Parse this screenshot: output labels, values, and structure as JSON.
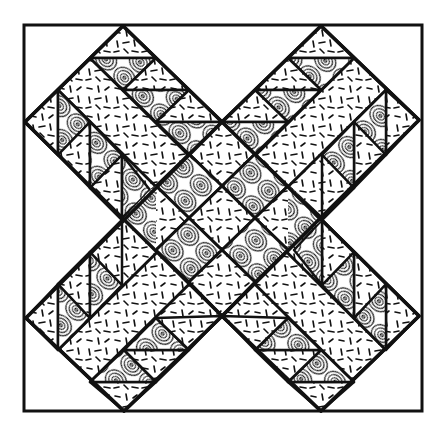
{
  "diagram": {
    "layout": "two crossing diagonal arms (X) inside a square frame",
    "colors": {
      "background": "#ffffff",
      "outline": "#111111",
      "swirl_fill": "#ffffff",
      "confetti_fill": "#ffffff"
    },
    "fabrics": [
      {
        "name": "confetti",
        "description": "white with short black dashes"
      },
      {
        "name": "swirl",
        "description": "concentric oval rings"
      }
    ],
    "frame": {
      "x": 24,
      "y": 25,
      "width": 398,
      "height": 386
    },
    "center": {
      "x": 222,
      "y": 218
    },
    "arms": [
      {
        "name": "arm-top-left-to-bottom-right",
        "direction": "diagonal \\"
      },
      {
        "name": "arm-top-right-to-bottom-left",
        "direction": "diagonal /"
      }
    ],
    "apexes": {
      "top_left_arm": {
        "x": 123,
        "y": 26
      },
      "top_right_arm": {
        "x": 321,
        "y": 26
      },
      "left_upper": {
        "x": 25,
        "y": 122
      },
      "left_lower": {
        "x": 26,
        "y": 318
      },
      "right_upper": {
        "x": 419,
        "y": 120
      },
      "right_lower": {
        "x": 419,
        "y": 316
      },
      "bottom_left_arm": {
        "x": 124,
        "y": 411
      },
      "bottom_right_arm": {
        "x": 321,
        "y": 411
      },
      "top_notch": {
        "x": 222,
        "y": 122
      },
      "bottom_notch": {
        "x": 222,
        "y": 316
      }
    }
  }
}
